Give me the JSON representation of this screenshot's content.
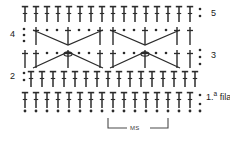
{
  "diagram": {
    "language": "es",
    "colors": {
      "stroke": "#2b2b2b",
      "dot": "#2b2b2b",
      "background": "#ffffff",
      "bracket": "#4a4a4a",
      "text": "#1a1a1a"
    },
    "row_labels": [
      {
        "id": "row-5",
        "text": "5",
        "side": "right",
        "x": 211,
        "y": 14
      },
      {
        "id": "row-4",
        "text": "4",
        "side": "left",
        "x": 10,
        "y": 35
      },
      {
        "id": "row-3",
        "text": "3",
        "side": "right",
        "x": 211,
        "y": 56
      },
      {
        "id": "row-2",
        "text": "2",
        "side": "left",
        "x": 10,
        "y": 77
      },
      {
        "id": "row-1",
        "text": "1.",
        "sup": "a",
        "suffix": " fila",
        "side": "right",
        "x": 197,
        "y": 96
      }
    ],
    "repeat_bracket": {
      "label": "MS",
      "x_start": 108,
      "x_end": 168,
      "y": 127
    },
    "legend_note": "",
    "stitch_counts": {
      "row5_treble": 16,
      "row2_treble": 16,
      "row1_treble": 16,
      "foundation_chain": 17
    }
  }
}
